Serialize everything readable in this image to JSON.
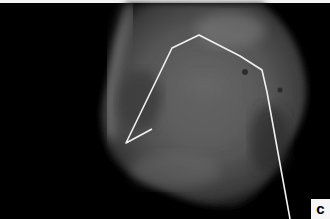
{
  "image": {
    "description": "Grayscale radiograph of a specimen with a traced white outline annotation",
    "panel_label": "c",
    "colors": {
      "background": "#000000",
      "annotation_line": "#f0f0f0",
      "label_background": "#f6f6f6",
      "label_text": "#000000"
    }
  }
}
